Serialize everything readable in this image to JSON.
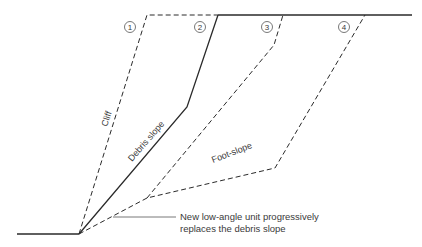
{
  "diagram": {
    "stage_labels": [
      "1",
      "2",
      "3",
      "4"
    ],
    "line_labels": {
      "cliff": "Cliff",
      "debris_slope": "Debris slope",
      "foot_slope": "Foot-slope"
    },
    "annotation": {
      "line1": "New low-angle unit progressively",
      "line2": "replaces the debris slope"
    },
    "colors": {
      "line": "#2a2a2a",
      "text": "#3a3a3a",
      "background": "#ffffff"
    }
  }
}
